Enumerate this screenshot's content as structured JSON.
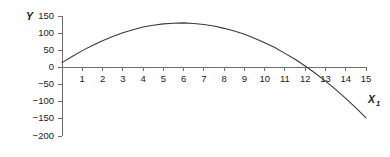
{
  "chart_data": {
    "type": "line",
    "title": "",
    "xlabel": "X1",
    "ylabel": "Y",
    "xlim": [
      0,
      15
    ],
    "ylim": [
      -200,
      150
    ],
    "grid": false,
    "legend": "none",
    "x_ticks": [
      1,
      2,
      3,
      4,
      5,
      6,
      7,
      8,
      9,
      10,
      11,
      12,
      13,
      14,
      15
    ],
    "y_ticks": [
      150,
      100,
      50,
      0,
      -50,
      -100,
      -150,
      -200
    ],
    "x_tick_labels": [
      "1",
      "2",
      "3",
      "4",
      "5",
      "6",
      "7",
      "8",
      "9",
      "10",
      "11",
      "12",
      "13",
      "14",
      "15"
    ],
    "y_tick_labels": [
      "150",
      "100",
      "50",
      "0",
      "-50",
      "-100",
      "-150",
      "-200"
    ],
    "series": [
      {
        "name": "quadratic curve",
        "color": "#3a3a3a",
        "x": [
          0,
          0.5,
          1,
          1.5,
          2,
          2.5,
          3,
          3.5,
          4,
          4.5,
          5,
          5.5,
          6,
          6.5,
          7,
          7.5,
          8,
          8.5,
          9,
          9.5,
          10,
          10.5,
          11,
          11.5,
          12,
          12.5,
          13,
          13.5,
          14,
          14.5,
          15
        ],
        "y": [
          14,
          32,
          49,
          64,
          78,
          90,
          101,
          110,
          118,
          123,
          127,
          129,
          130,
          128,
          125,
          121,
          114,
          106,
          97,
          85,
          72,
          58,
          41,
          24,
          4,
          -17,
          -40,
          -64,
          -90,
          -118,
          -147
        ]
      }
    ],
    "annotations": []
  },
  "axis_labels": {
    "y_axis_title": "Y",
    "x_axis_title": "X",
    "x_axis_subscript": "1"
  },
  "colors": {
    "curve": "#3a3a3a",
    "axis": "#6d6d6d",
    "text": "#1a1a1a",
    "background": "#ffffff"
  }
}
